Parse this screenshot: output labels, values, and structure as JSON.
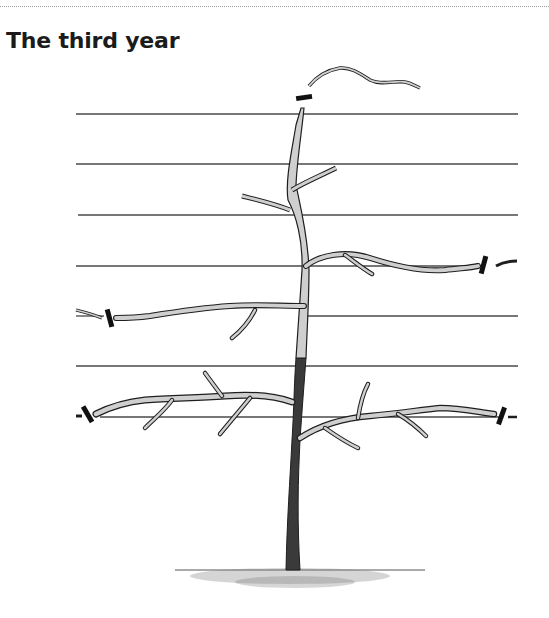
{
  "page": {
    "heading": "The third year"
  },
  "illustration": {
    "subject": "espalier-tree-third-year-pruning",
    "wires_y": [
      114,
      164,
      215,
      266,
      316,
      366,
      417
    ],
    "wire_x_start": 76,
    "wire_x_end": 518,
    "colors": {
      "ink": "#1e1e1e",
      "bark_light": "#cfcfcf",
      "bark_dark": "#3a3a3a",
      "wire": "#4a4a4a",
      "background": "#ffffff"
    },
    "cut_marks": [
      {
        "name": "leader-cut",
        "x": 303,
        "y": 98
      },
      {
        "name": "upper-right-tier-cut",
        "x": 484,
        "y": 265
      },
      {
        "name": "middle-left-tier-cut",
        "x": 110,
        "y": 318
      },
      {
        "name": "lower-left-tier-cut",
        "x": 88,
        "y": 414
      },
      {
        "name": "lower-right-tier-cut",
        "x": 502,
        "y": 416
      }
    ]
  }
}
